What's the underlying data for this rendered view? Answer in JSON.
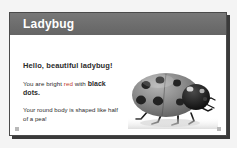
{
  "slide": {
    "title": "Ladybug",
    "title_bar_color": "#6f6f6f",
    "card_background": "#ffffff",
    "page_background": "#f4f4f4",
    "border_color": "#4a4a4a"
  },
  "content": {
    "greeting": "Hello, beautiful ladybug!",
    "sentence_red": {
      "lead": "You are bright ",
      "red_word": "red",
      "middle": " with ",
      "bold_word": "black",
      "tail": " dots."
    },
    "sentence_shape": "Your round body is shaped like half of a pea!",
    "red_word_color": "#c0392b",
    "text_color": "#2b2b2b"
  },
  "figure": {
    "name": "ladybug-photo",
    "alt": "Grayscale photograph of a ladybug with black spots",
    "shell_color": "#8d8d8d",
    "spot_color": "#232323",
    "head_color": "#1c1c1c",
    "leg_color": "#1a1a1a"
  },
  "corners": {
    "left_mark": "corner-mark",
    "right_mark": "corner-mark"
  }
}
